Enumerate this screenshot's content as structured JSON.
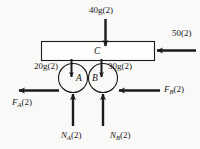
{
  "figure": {
    "type": "free-body-diagram",
    "background_color": "#f9f9f7",
    "stroke_color": "#1b1b1b",
    "bodies": {
      "bar": {
        "letter": "C",
        "shape": "rectangle"
      },
      "wheel_a": {
        "letter": "A",
        "shape": "circle"
      },
      "wheel_b": {
        "letter": "B",
        "shape": "circle"
      }
    },
    "labels": {
      "weight_bar": "40g(2)",
      "applied_right": "50(2)",
      "weight_a": "20g(2)",
      "weight_b": "30g(2)",
      "friction_a_main": "F",
      "friction_a_sub": "A",
      "friction_a_tail": "(2)",
      "friction_b_main": "F",
      "friction_b_sub": "B",
      "friction_b_tail": "(2)",
      "normal_a_main": "N",
      "normal_a_sub": "A",
      "normal_a_tail": "(2)",
      "normal_b_main": "N",
      "normal_b_sub": "B",
      "normal_b_tail": "(2)"
    },
    "forces": [
      {
        "name": "weight-bar-arrow",
        "label": "40g(2)",
        "direction": "down",
        "applied_to": "C"
      },
      {
        "name": "applied-load-arrow",
        "label": "50(2)",
        "direction": "left",
        "applied_to": "C"
      },
      {
        "name": "weight-a-arrow",
        "label": "20g(2)",
        "direction": "down",
        "applied_to": "A"
      },
      {
        "name": "weight-b-arrow",
        "label": "30g(2)",
        "direction": "down",
        "applied_to": "B"
      },
      {
        "name": "friction-a-arrow",
        "label": "F_A(2)",
        "direction": "left",
        "applied_to": "A"
      },
      {
        "name": "friction-b-arrow",
        "label": "F_B(2)",
        "direction": "left",
        "applied_to": "B"
      },
      {
        "name": "normal-a-arrow",
        "label": "N_A(2)",
        "direction": "up",
        "applied_to": "A"
      },
      {
        "name": "normal-b-arrow",
        "label": "N_B(2)",
        "direction": "up",
        "applied_to": "B"
      }
    ]
  }
}
